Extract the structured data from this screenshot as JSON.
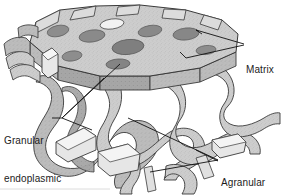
{
  "figure": {
    "kind": "biological-illustration",
    "alt": "Cutaway illustration of endoplasmic reticulum showing a textured fenestrated slab above a branching tubular network",
    "background_color": "#ffffff",
    "outline_color": "#1b1b1b",
    "baseline_rule_color": "#d9d9d9",
    "palette": {
      "texture_light": "#cdcdcd",
      "texture_mid": "#b3b3b3",
      "shadow_mid": "#a3a3a3",
      "pore_dark": "#8a8a8a",
      "pore_darker": "#7b7b7b",
      "highlight_white": "#ffffff",
      "edge_light": "#e2e2e2"
    }
  },
  "labels": {
    "matrix": {
      "text": "Matrix",
      "lines": [
        "Matrix"
      ],
      "anchor_x": 246,
      "anchor_y": 39,
      "leader_count": 2
    },
    "granular": {
      "text": "Granular endoplasmic reticulum",
      "lines": [
        "Granular",
        "endoplasmic",
        "reticulum"
      ],
      "anchor_x": 4,
      "anchor_y": 110,
      "leader_count": 3
    },
    "agranular": {
      "text": "Agranular endoplasmic reticulum",
      "lines": [
        "Agranular",
        "endoplasmic",
        "reticulum"
      ],
      "anchor_x": 221,
      "anchor_y": 152,
      "leader_count": 3
    }
  }
}
